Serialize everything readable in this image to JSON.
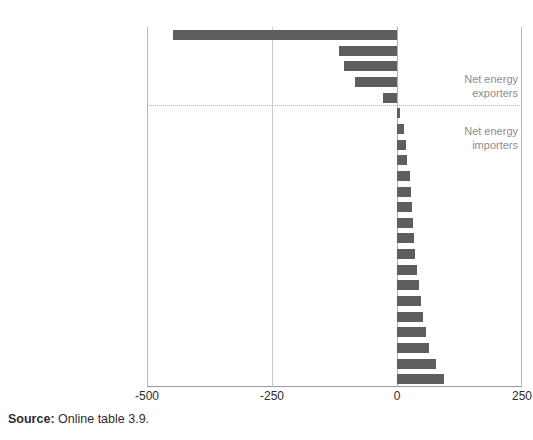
{
  "figure": {
    "title_partial": "",
    "source_label": "Source:",
    "source_text": "Online table 3.9."
  },
  "annotations": {
    "exporters_line1": "Net energy",
    "exporters_line2": "exporters",
    "importers_line1": "Net energy",
    "importers_line2": "importers"
  },
  "colors": {
    "bar": "#5e5e5e",
    "gridline": "#c9c9c9",
    "annotation_text": "#8d8d8d",
    "axis_text": "#2d2d2d"
  },
  "chart_data": {
    "type": "bar",
    "orientation": "horizontal",
    "title": "",
    "xlabel": "",
    "ylabel": "",
    "xlim": [
      -500,
      250
    ],
    "xticks": [
      -500,
      -250,
      0,
      250
    ],
    "xticklabels": [
      "-500",
      "-250",
      "0",
      "250"
    ],
    "grid": true,
    "legend": "none",
    "zero_line": 0,
    "separator_after_category": "Uzbekistan",
    "groups": [
      {
        "name": "Net energy exporters",
        "categories": [
          "Azerbaijan",
          "Turkmenistan",
          "Kazakhstan",
          "Russian Federation",
          "Uzbekistan"
        ]
      },
      {
        "name": "Net energy importers",
        "categories": [
          "Montenegro",
          "Romania",
          "Albania",
          "Kosovo",
          "Bosnia & Herzegovina",
          "Serbia",
          "Poland",
          "Tajikistan",
          "Bulgaria",
          "Ukraine",
          "Macedonia, FYR",
          "Croatia",
          "Georgia",
          "Kyrgyz Rep.",
          "Armenia",
          "Turkey",
          "Belarus",
          "Moldova"
        ]
      }
    ],
    "categories": [
      "Azerbaijan",
      "Turkmenistan",
      "Kazakhstan",
      "Russian Federation",
      "Uzbekistan",
      "Montenegro",
      "Romania",
      "Albania",
      "Kosovo",
      "Bosnia & Herzegovina",
      "Serbia",
      "Poland",
      "Tajikistan",
      "Bulgaria",
      "Ukraine",
      "Macedonia, FYR",
      "Croatia",
      "Georgia",
      "Kyrgyz Rep.",
      "Armenia",
      "Turkey",
      "Belarus",
      "Moldova"
    ],
    "values": [
      -448,
      -116,
      -106,
      -84,
      -28,
      6,
      14,
      18,
      20,
      26,
      28,
      30,
      32,
      34,
      36,
      40,
      44,
      48,
      52,
      58,
      64,
      78,
      94
    ]
  }
}
